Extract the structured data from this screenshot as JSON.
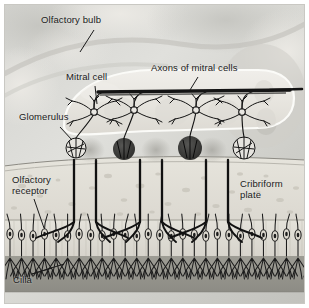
{
  "figure": {
    "type": "anatomical-illustration",
    "style": "grayscale photographic background with line-drawing overlay",
    "border_color": "#ffffff"
  },
  "labels": {
    "olfactory_bulb": "Olfactory bulb",
    "mitral_cell": "Mitral cell",
    "axons_of_mitral_cells": "Axons of mitral cells",
    "glomerulus": "Glomerulus",
    "olfactory_receptor": "Olfactory\nreceptor",
    "cribriform_plate": "Cribriform\nplate",
    "cilia": "Cilia"
  },
  "structures": {
    "olfactory_bulb": {
      "name": "olfactory-bulb",
      "fill": "#e9e7e2",
      "outline": "#f7f7f4"
    },
    "mitral_cells": {
      "count": 4,
      "stroke": "#141414"
    },
    "glomeruli": {
      "count": 4,
      "filled_dark": 2,
      "open": 2,
      "dark_fill": "#3b3b3b"
    },
    "cribriform_plate": {
      "name": "cribriform-plate",
      "fill": "#e2e0d8",
      "channels": 3
    },
    "olfactory_epithelium": {
      "fill": "#e0ded6"
    },
    "mucus_layer": {
      "fill": "#98978f"
    },
    "receptor_cells": {
      "count": 26,
      "stroke": "#1a1a1a"
    }
  },
  "colors": {
    "background": "#d9d9d6",
    "ink": "#141414",
    "text": "#1a1a1a"
  }
}
